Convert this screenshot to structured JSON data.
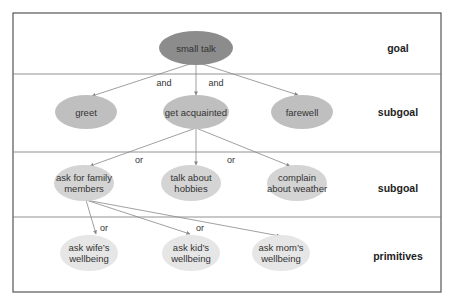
{
  "diagram": {
    "levels": [
      {
        "label": "goal",
        "y": 48
      },
      {
        "label": "subgoal",
        "y": 112
      },
      {
        "label": "subgoal",
        "y": 188
      },
      {
        "label": "primitives",
        "y": 256
      }
    ],
    "nodes": [
      {
        "id": "small_talk",
        "lines": [
          "small talk"
        ],
        "x": 196,
        "y": 48,
        "rx": 37,
        "ry": 17,
        "fill": "#8c8c8c"
      },
      {
        "id": "greet",
        "lines": [
          "greet"
        ],
        "x": 86,
        "y": 112,
        "rx": 31,
        "ry": 17,
        "fill": "#bfbfbf"
      },
      {
        "id": "get_acquainted",
        "lines": [
          "get acquainted"
        ],
        "x": 196,
        "y": 112,
        "rx": 33,
        "ry": 17,
        "fill": "#bfbfbf"
      },
      {
        "id": "farewell",
        "lines": [
          "farewell"
        ],
        "x": 302,
        "y": 112,
        "rx": 31,
        "ry": 17,
        "fill": "#bfbfbf"
      },
      {
        "id": "ask_family",
        "lines": [
          "ask for family",
          "members"
        ],
        "x": 84,
        "y": 183,
        "rx": 30,
        "ry": 18,
        "fill": "#d4d4d4"
      },
      {
        "id": "talk_hobbies",
        "lines": [
          "talk about",
          "hobbies"
        ],
        "x": 191,
        "y": 183,
        "rx": 30,
        "ry": 18,
        "fill": "#d4d4d4"
      },
      {
        "id": "complain_weather",
        "lines": [
          "complain",
          "about weather"
        ],
        "x": 297,
        "y": 183,
        "rx": 30,
        "ry": 18,
        "fill": "#d4d4d4"
      },
      {
        "id": "ask_wife",
        "lines": [
          "ask wife’s",
          "wellbeing"
        ],
        "x": 89,
        "y": 253,
        "rx": 29,
        "ry": 18,
        "fill": "#e6e6e6"
      },
      {
        "id": "ask_kid",
        "lines": [
          "ask kid’s",
          "wellbeing"
        ],
        "x": 191,
        "y": 253,
        "rx": 29,
        "ry": 18,
        "fill": "#e6e6e6"
      },
      {
        "id": "ask_mom",
        "lines": [
          "ask mom’s",
          "wellbeing"
        ],
        "x": 281,
        "y": 253,
        "rx": 29,
        "ry": 18,
        "fill": "#e6e6e6"
      }
    ],
    "edges": [
      {
        "from": [
          196,
          62
        ],
        "to": [
          92,
          96
        ]
      },
      {
        "from": [
          196,
          62
        ],
        "to": [
          196,
          95
        ]
      },
      {
        "from": [
          196,
          62
        ],
        "to": [
          298,
          95
        ]
      },
      {
        "from": [
          196,
          128
        ],
        "to": [
          90,
          166
        ]
      },
      {
        "from": [
          196,
          128
        ],
        "to": [
          196,
          165
        ]
      },
      {
        "from": [
          196,
          128
        ],
        "to": [
          290,
          166
        ]
      },
      {
        "from": [
          86,
          200
        ],
        "to": [
          96,
          234
        ]
      },
      {
        "from": [
          86,
          200
        ],
        "to": [
          190,
          234
        ]
      },
      {
        "from": [
          86,
          200
        ],
        "to": [
          280,
          236
        ]
      }
    ],
    "edge_labels": [
      {
        "text": "and",
        "x": 164,
        "y": 86
      },
      {
        "text": "and",
        "x": 216,
        "y": 86
      },
      {
        "text": "or",
        "x": 139,
        "y": 163
      },
      {
        "text": "or",
        "x": 231,
        "y": 163
      },
      {
        "text": "or",
        "x": 104,
        "y": 231
      },
      {
        "text": "or",
        "x": 200,
        "y": 231
      }
    ],
    "frame": {
      "x": 13,
      "y": 13,
      "w": 428,
      "h": 279,
      "dividers": [
        74,
        152,
        217
      ]
    }
  }
}
